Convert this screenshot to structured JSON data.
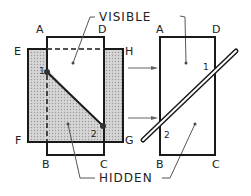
{
  "diagram": {
    "labels": {
      "visible": "VISIBLE",
      "hidden": "HIDDEN"
    },
    "left_view": {
      "corners": {
        "A": "A",
        "D": "D",
        "B": "B",
        "C": "C",
        "E": "E",
        "H": "H",
        "F": "F",
        "G": "G"
      },
      "points": {
        "p1": "1",
        "p2": "2"
      }
    },
    "right_view": {
      "corners": {
        "A": "A",
        "D": "D",
        "B": "B",
        "C": "C"
      },
      "points": {
        "p1": "1",
        "p2": "2"
      }
    },
    "colors": {
      "line": "#1a1a1a",
      "hatch_fill": "#c8c8c8",
      "background": "#ffffff"
    }
  }
}
